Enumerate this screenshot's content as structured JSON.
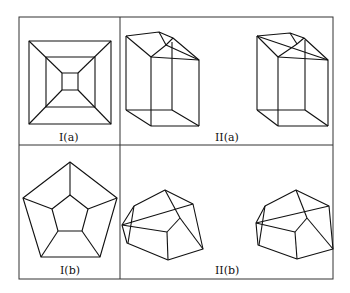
{
  "figure": {
    "panels": [
      {
        "id": "Ia",
        "label": "I(a)",
        "description": "Schlegel diagram of a cube-like graph: nested squares with connecting diagonals"
      },
      {
        "id": "IIa",
        "label": "II(a)",
        "description": "Two 3D polyhedron realizations (prism with truncated top)"
      },
      {
        "id": "Ib",
        "label": "I(b)",
        "description": "Schlegel diagram of a dodecahedron-like graph: nested pentagons with spokes"
      },
      {
        "id": "IIb",
        "label": "II(b)",
        "description": "Two 3D polyhedron realizations"
      }
    ]
  }
}
